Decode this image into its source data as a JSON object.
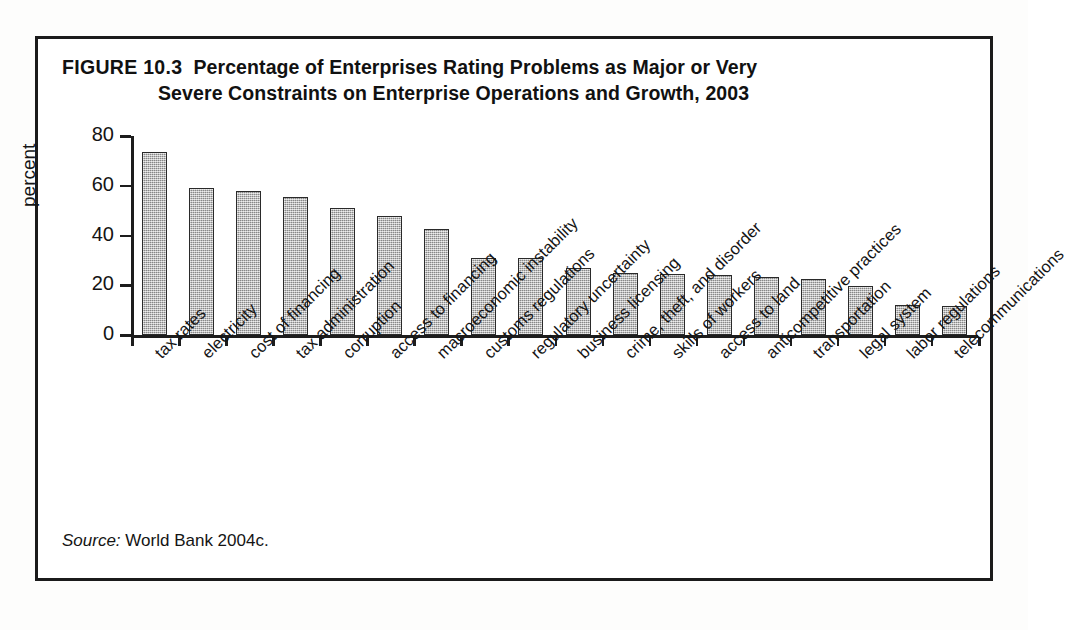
{
  "figure": {
    "label": "FIGURE 10.3",
    "title_line1": "Percentage of Enterprises Rating Problems as Major or Very",
    "title_line2": "Severe Constraints on Enterprise Operations and Growth, 2003",
    "source_label": "Source:",
    "source_text": "World Bank 2004c.",
    "frame_color": "#1b1b1b",
    "bar_fill_color": "#b0b0b0",
    "bar_outline_color": "#2a2a2a",
    "text_color": "#141414"
  },
  "chart_data": {
    "type": "bar",
    "title": "Percentage of Enterprises Rating Problems as Major or Very Severe Constraints on Enterprise Operations and Growth, 2003",
    "xlabel": "",
    "ylabel": "percent",
    "ylim": [
      0,
      80
    ],
    "yticks": [
      0,
      20,
      40,
      60,
      80
    ],
    "ytick_labels": [
      "0",
      "20",
      "40",
      "60",
      "80"
    ],
    "grid": false,
    "legend": false,
    "orientation": "vertical",
    "categories": [
      "tax rates",
      "electricity",
      "cost of financing",
      "tax administration",
      "corruption",
      "access to financing",
      "macroeconomic instability",
      "customs regulations",
      "regulatory uncertainty",
      "business licensing",
      "crime, theft, and disorder",
      "skills of workers",
      "access to land",
      "anticompetitive practices",
      "transportation",
      "legal system",
      "labor regulations",
      "telecommunications"
    ],
    "values": [
      73.5,
      59,
      58,
      55.5,
      51,
      48,
      42.5,
      31,
      31,
      27,
      25,
      24.5,
      24,
      23.5,
      22.5,
      19.5,
      12,
      11.5
    ]
  }
}
